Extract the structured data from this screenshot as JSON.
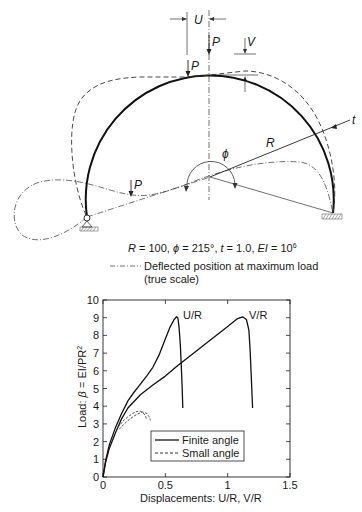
{
  "diagram": {
    "labels": {
      "U": "U",
      "P_top": "P",
      "V": "V",
      "P_inner": "P",
      "P_left": "P",
      "t": "t",
      "R": "R",
      "phi": "ϕ"
    },
    "parameters_text": {
      "R_part": "R",
      "R_val": " = 100, ",
      "phi_part": "ϕ",
      "phi_val": " = 215°, ",
      "t_part": "t",
      "t_val": " = 1.0, ",
      "EI_part": "EI",
      "EI_val": " = 10",
      "EI_exp": "6"
    },
    "legend": {
      "line1": "Deflected position at maximum load",
      "line2": "(true scale)"
    },
    "parameters": {
      "R": 100,
      "phi_deg": 215,
      "t": 1.0,
      "EI": "10^6"
    }
  },
  "chart_data": {
    "type": "line",
    "title": "",
    "xlabel": "Displacements: U/R, V/R",
    "ylabel_prefix": "Load: ",
    "ylabel_beta": "β",
    "ylabel_rest": " = EI/PR",
    "ylabel_exp": "2",
    "xlim": [
      0,
      1.5
    ],
    "ylim": [
      0,
      10
    ],
    "xticks": [
      0,
      0.5,
      1,
      1.5
    ],
    "xtick_labels": [
      "0",
      "0.5",
      "1",
      "1.5"
    ],
    "yticks": [
      0,
      1,
      2,
      3,
      4,
      5,
      6,
      7,
      8,
      9,
      10
    ],
    "ytick_labels": [
      "0",
      "1",
      "2",
      "3",
      "4",
      "5",
      "6",
      "7",
      "8",
      "9",
      "10"
    ],
    "grid": false,
    "legend_position": "lower-center",
    "legend": [
      {
        "name": "Finite angle",
        "style": "solid"
      },
      {
        "name": "Small angle",
        "style": "dashed"
      }
    ],
    "annotations": [
      {
        "text": "U/R",
        "x": 0.64,
        "y": 9.1
      },
      {
        "text": "V/R",
        "x": 1.2,
        "y": 9.1
      }
    ],
    "series": [
      {
        "name": "Finite angle U/R",
        "style": "solid",
        "x": [
          0,
          0.02,
          0.05,
          0.1,
          0.15,
          0.2,
          0.25,
          0.3,
          0.35,
          0.4,
          0.45,
          0.5,
          0.54,
          0.57,
          0.59,
          0.6,
          0.61,
          0.62,
          0.63,
          0.635,
          0.64
        ],
        "y": [
          0,
          0.9,
          1.8,
          2.8,
          3.6,
          4.3,
          4.8,
          5.25,
          5.7,
          6.2,
          6.9,
          7.8,
          8.5,
          8.9,
          9.05,
          9.0,
          8.5,
          7.5,
          6.0,
          5.0,
          3.9
        ]
      },
      {
        "name": "Finite angle V/R",
        "style": "solid",
        "x": [
          0,
          0.02,
          0.05,
          0.1,
          0.15,
          0.2,
          0.3,
          0.4,
          0.5,
          0.6,
          0.7,
          0.8,
          0.9,
          1.0,
          1.08,
          1.12,
          1.15,
          1.17,
          1.18,
          1.19,
          1.2
        ],
        "y": [
          0,
          0.8,
          1.6,
          2.5,
          3.3,
          3.9,
          4.65,
          5.2,
          5.7,
          6.3,
          6.85,
          7.4,
          7.95,
          8.5,
          8.95,
          9.05,
          8.9,
          8.3,
          7.2,
          5.5,
          3.9
        ]
      },
      {
        "name": "Small angle U/R",
        "style": "dashed",
        "x": [
          0.12,
          0.16,
          0.2,
          0.24,
          0.27,
          0.3,
          0.32,
          0.34,
          0.35
        ],
        "y": [
          2.8,
          3.15,
          3.4,
          3.6,
          3.7,
          3.72,
          3.65,
          3.45,
          3.25
        ]
      },
      {
        "name": "Small angle V/R",
        "style": "dashed",
        "x": [
          0.13,
          0.17,
          0.21,
          0.25,
          0.29,
          0.32,
          0.35,
          0.37,
          0.38
        ],
        "y": [
          2.7,
          3.0,
          3.25,
          3.45,
          3.6,
          3.68,
          3.6,
          3.4,
          3.2
        ]
      }
    ]
  }
}
